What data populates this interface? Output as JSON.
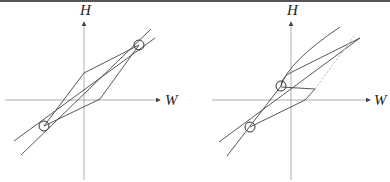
{
  "figure": {
    "panels": [
      {
        "id": "left",
        "y_axis_label": "H",
        "x_axis_label": "W",
        "description": "Two straight lines crossing at two circled points, with a parallelogram loop between them"
      },
      {
        "id": "right",
        "y_axis_label": "H",
        "x_axis_label": "W",
        "description": "Lines with a curved upper branch, a dotted segment, and two circled intersection points"
      }
    ],
    "colors": {
      "axis": "#999999",
      "line": "#444444",
      "dotted": "#aaaaaa"
    }
  }
}
